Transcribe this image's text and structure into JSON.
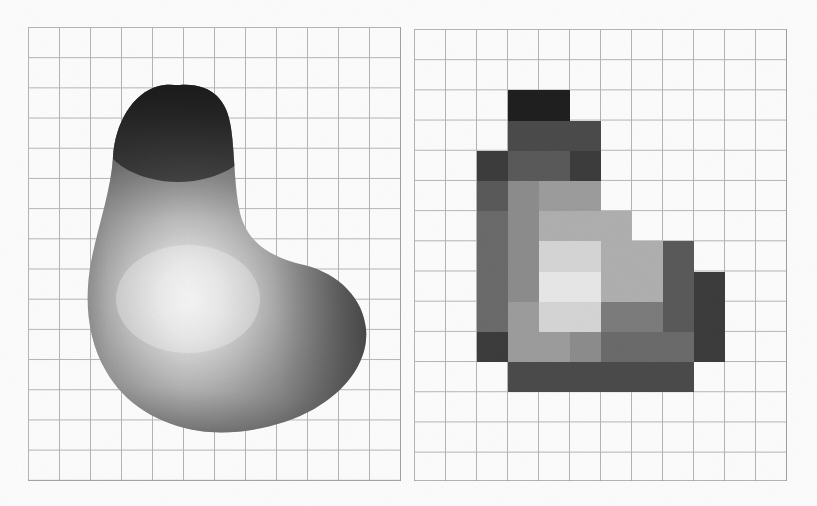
{
  "figure": {
    "background_color": "#fdfdfd",
    "width": 817,
    "height": 506,
    "panel_count": 2,
    "caption": ""
  },
  "grid": {
    "line_color": "#9a9a9a",
    "cell_width": 31,
    "cell_height": 30.2,
    "columns": 12,
    "rows": 15,
    "visible": true
  },
  "left_panel": {
    "name": "continuous-shaded-blob",
    "label": "",
    "origin": {
      "x": 28,
      "y": 27
    },
    "size": {
      "width": 373,
      "height": 454
    },
    "shading": {
      "highlight_color": "#f2f2f2",
      "midtone_color": "#8d8d8d",
      "shadow_color": "#3a3a3a",
      "deep_shadow_color": "#1d1d1d",
      "highlight_center": {
        "x": 0.44,
        "y": 0.6
      }
    }
  },
  "right_panel": {
    "name": "pixelated-blob",
    "label": "",
    "origin": {
      "x": 414,
      "y": 29
    },
    "size": {
      "width": 373,
      "height": 452
    },
    "palette": {
      "p0": "#1f1f1f",
      "p1": "#3c3c3c",
      "p2": "#4b4b4b",
      "p3": "#5a5a5a",
      "p4": "#6b6b6b",
      "p5": "#7c7c7c",
      "p6": "#8d8d8d",
      "p7": "#9d9d9d",
      "p8": "#b0b0b0",
      "p9": "#c3c3c3",
      "p10": "#d6d6d6",
      "p11": "#e8e8e8"
    },
    "cells": [
      {
        "col": 3,
        "row": 2,
        "shade": "p0"
      },
      {
        "col": 4,
        "row": 2,
        "shade": "p0"
      },
      {
        "col": 3,
        "row": 3,
        "shade": "p2"
      },
      {
        "col": 4,
        "row": 3,
        "shade": "p2"
      },
      {
        "col": 5,
        "row": 3,
        "shade": "p2"
      },
      {
        "col": 2,
        "row": 4,
        "shade": "p1"
      },
      {
        "col": 3,
        "row": 4,
        "shade": "p3"
      },
      {
        "col": 4,
        "row": 4,
        "shade": "p3"
      },
      {
        "col": 5,
        "row": 4,
        "shade": "p1"
      },
      {
        "col": 2,
        "row": 5,
        "shade": "p3"
      },
      {
        "col": 3,
        "row": 5,
        "shade": "p6"
      },
      {
        "col": 4,
        "row": 5,
        "shade": "p7"
      },
      {
        "col": 5,
        "row": 5,
        "shade": "p7"
      },
      {
        "col": 2,
        "row": 6,
        "shade": "p4"
      },
      {
        "col": 3,
        "row": 6,
        "shade": "p6"
      },
      {
        "col": 4,
        "row": 6,
        "shade": "p8"
      },
      {
        "col": 5,
        "row": 6,
        "shade": "p8"
      },
      {
        "col": 6,
        "row": 6,
        "shade": "p8"
      },
      {
        "col": 2,
        "row": 7,
        "shade": "p4"
      },
      {
        "col": 3,
        "row": 7,
        "shade": "p6"
      },
      {
        "col": 4,
        "row": 7,
        "shade": "p10"
      },
      {
        "col": 5,
        "row": 7,
        "shade": "p10"
      },
      {
        "col": 6,
        "row": 7,
        "shade": "p8"
      },
      {
        "col": 7,
        "row": 7,
        "shade": "p8"
      },
      {
        "col": 8,
        "row": 7,
        "shade": "p3"
      },
      {
        "col": 2,
        "row": 8,
        "shade": "p4"
      },
      {
        "col": 3,
        "row": 8,
        "shade": "p6"
      },
      {
        "col": 4,
        "row": 8,
        "shade": "p11"
      },
      {
        "col": 5,
        "row": 8,
        "shade": "p11"
      },
      {
        "col": 6,
        "row": 8,
        "shade": "p8"
      },
      {
        "col": 7,
        "row": 8,
        "shade": "p8"
      },
      {
        "col": 8,
        "row": 8,
        "shade": "p3"
      },
      {
        "col": 9,
        "row": 8,
        "shade": "p1"
      },
      {
        "col": 2,
        "row": 9,
        "shade": "p4"
      },
      {
        "col": 3,
        "row": 9,
        "shade": "p7"
      },
      {
        "col": 4,
        "row": 9,
        "shade": "p10"
      },
      {
        "col": 5,
        "row": 9,
        "shade": "p10"
      },
      {
        "col": 6,
        "row": 9,
        "shade": "p5"
      },
      {
        "col": 7,
        "row": 9,
        "shade": "p5"
      },
      {
        "col": 8,
        "row": 9,
        "shade": "p3"
      },
      {
        "col": 9,
        "row": 9,
        "shade": "p1"
      },
      {
        "col": 2,
        "row": 10,
        "shade": "p1"
      },
      {
        "col": 3,
        "row": 10,
        "shade": "p7"
      },
      {
        "col": 4,
        "row": 10,
        "shade": "p7"
      },
      {
        "col": 5,
        "row": 10,
        "shade": "p6"
      },
      {
        "col": 6,
        "row": 10,
        "shade": "p4"
      },
      {
        "col": 7,
        "row": 10,
        "shade": "p4"
      },
      {
        "col": 8,
        "row": 10,
        "shade": "p4"
      },
      {
        "col": 9,
        "row": 10,
        "shade": "p1"
      },
      {
        "col": 3,
        "row": 11,
        "shade": "p2"
      },
      {
        "col": 4,
        "row": 11,
        "shade": "p2"
      },
      {
        "col": 5,
        "row": 11,
        "shade": "p2"
      },
      {
        "col": 6,
        "row": 11,
        "shade": "p2"
      },
      {
        "col": 7,
        "row": 11,
        "shade": "p2"
      },
      {
        "col": 8,
        "row": 11,
        "shade": "p2"
      }
    ]
  }
}
